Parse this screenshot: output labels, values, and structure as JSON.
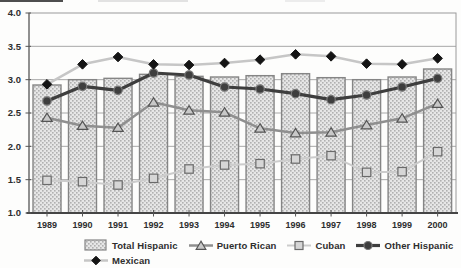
{
  "chart_data": {
    "type": "combo",
    "title": "",
    "xlabel": "",
    "ylabel": "",
    "categories": [
      "1989",
      "1990",
      "1991",
      "1992",
      "1993",
      "1994",
      "1995",
      "1996",
      "1997",
      "1998",
      "1999",
      "2000"
    ],
    "series": [
      {
        "name": "Total Hispanic",
        "type": "bar",
        "marker": "bar",
        "color": "#e6e6e6",
        "pattern_dot": "#b0b0b0",
        "border": "#858585",
        "values": [
          2.92,
          3.0,
          3.02,
          3.08,
          3.05,
          3.04,
          3.06,
          3.09,
          3.03,
          3.0,
          3.04,
          3.16
        ]
      },
      {
        "name": "Puerto Rican",
        "type": "line",
        "marker": "triangle",
        "color": "#8f8f8f",
        "marker_fill": "#c8c8c8",
        "marker_stroke": "#555555",
        "values": [
          2.43,
          2.31,
          2.28,
          2.66,
          2.54,
          2.51,
          2.27,
          2.2,
          2.21,
          2.32,
          2.42,
          2.64
        ]
      },
      {
        "name": "Cuban",
        "type": "line",
        "marker": "square",
        "color": "#cccccc",
        "marker_fill": "#d6d6d6",
        "marker_stroke": "#6a6a6a",
        "values": [
          1.49,
          1.47,
          1.42,
          1.52,
          1.66,
          1.72,
          1.74,
          1.81,
          1.86,
          1.61,
          1.62,
          1.92
        ]
      },
      {
        "name": "Other Hispanic",
        "type": "line",
        "marker": "circle",
        "color": "#3e3e3e",
        "marker_fill": "#3e3e3e",
        "marker_stroke": "#787878",
        "values": [
          2.68,
          2.9,
          2.84,
          3.1,
          3.07,
          2.89,
          2.86,
          2.79,
          2.7,
          2.77,
          2.89,
          3.02
        ]
      },
      {
        "name": "Mexican",
        "type": "line",
        "marker": "diamond",
        "color": "#c6c6c6",
        "marker_fill": "#141414",
        "marker_stroke": "#141414",
        "values": [
          2.93,
          3.23,
          3.34,
          3.23,
          3.22,
          3.25,
          3.3,
          3.38,
          3.35,
          3.24,
          3.23,
          3.32
        ]
      }
    ],
    "ylim": [
      1.0,
      4.0
    ],
    "ytick_step": 0.5,
    "yticks": [
      "1.0",
      "1.5",
      "2.0",
      "2.5",
      "3.0",
      "3.5",
      "4.0"
    ],
    "grid": "horizontal",
    "legend_position": "bottom",
    "axis_text_color": "#2e2e2e",
    "grid_color": "#a8a8a8",
    "frame_color": "#9a9a9a",
    "axis_color": "#454545"
  },
  "legend_rows": [
    [
      0,
      1,
      2,
      3
    ],
    [
      4
    ]
  ]
}
